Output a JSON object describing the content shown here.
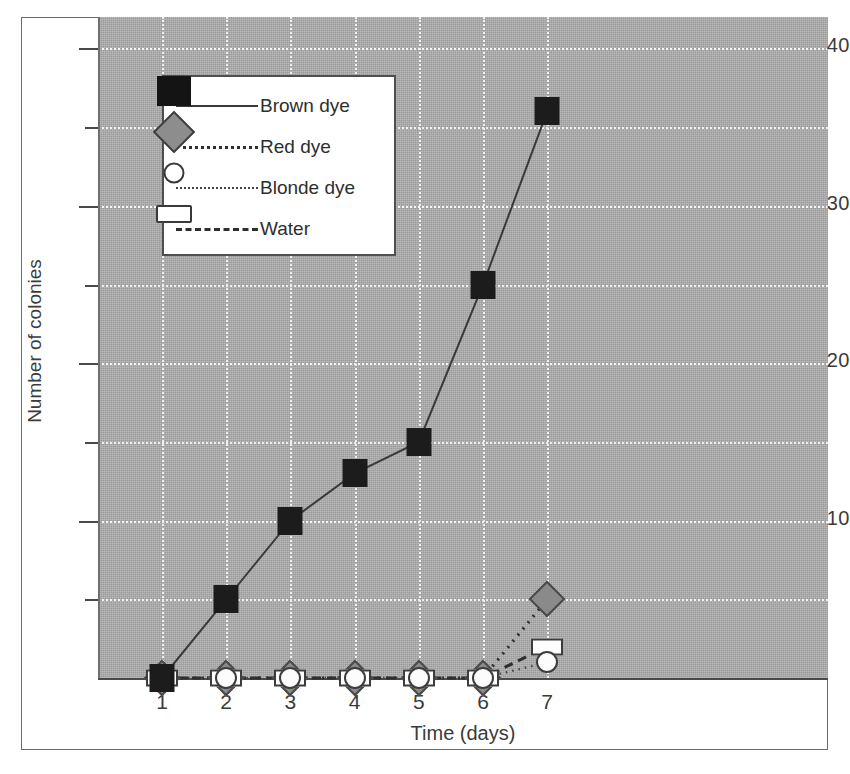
{
  "chart_data": {
    "type": "line",
    "title": "",
    "xlabel": "Time (days)",
    "ylabel": "Number of colonies",
    "x": [
      1,
      2,
      3,
      4,
      5,
      6,
      7
    ],
    "categories": [
      "1",
      "2",
      "3",
      "4",
      "5",
      "6",
      "7"
    ],
    "xlim": [
      0.6,
      7.6
    ],
    "ylim": [
      0,
      42
    ],
    "ytick_major": [
      10,
      20,
      30,
      40
    ],
    "ytick_minor": [
      5,
      15,
      25,
      35
    ],
    "ytick_labels": [
      "10",
      "20",
      "30",
      "40"
    ],
    "grid": true,
    "grid_color": "#f2f2f2",
    "plot_background": "#a9a9a9",
    "legend_position": "upper left",
    "series": [
      {
        "name": "Brown dye",
        "values": [
          0,
          5,
          10,
          13,
          15,
          25,
          36
        ],
        "marker": "filled-square",
        "marker_color": "#1c1c1c",
        "line_style": "solid",
        "line_color": "#3a3a3a"
      },
      {
        "name": "Red dye",
        "values": [
          0,
          0,
          0,
          0,
          0,
          0,
          5
        ],
        "marker": "gray-diamond",
        "marker_color": "#8a8a8a",
        "line_style": "dotted",
        "line_color": "#2f2f2f"
      },
      {
        "name": "Blonde dye",
        "values": [
          0,
          0,
          0,
          0,
          0,
          0,
          1
        ],
        "marker": "open-circle",
        "marker_color": "#ffffff",
        "line_style": "fine-dotted",
        "line_color": "#444444"
      },
      {
        "name": "Water",
        "values": [
          0,
          0,
          0,
          0,
          0,
          0,
          2
        ],
        "marker": "open-rectangle",
        "marker_color": "#ffffff",
        "line_style": "dashed",
        "line_color": "#2f2f2f"
      }
    ]
  },
  "legend": {
    "entries": [
      {
        "label": "Brown dye"
      },
      {
        "label": "Red dye"
      },
      {
        "label": "Blonde dye"
      },
      {
        "label": "Water"
      }
    ]
  }
}
